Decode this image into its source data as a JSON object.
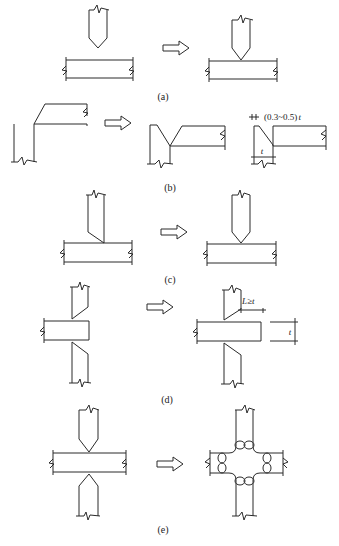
{
  "figure": {
    "panels": [
      {
        "id": "a",
        "caption": "(a)"
      },
      {
        "id": "b",
        "caption": "(b)",
        "annotation_gap": "(0.3~0.5)",
        "annotation_gap_var": "t",
        "annotation_thickness": "t"
      },
      {
        "id": "c",
        "caption": "(c)"
      },
      {
        "id": "d",
        "caption": "(d)",
        "annotation_length": "L≥t",
        "annotation_thickness": "t"
      },
      {
        "id": "e",
        "caption": "(e)"
      }
    ],
    "arrow_icon": "hollow-right-arrow"
  }
}
